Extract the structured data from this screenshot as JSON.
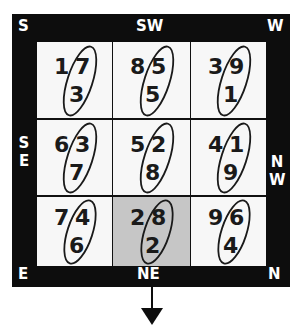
{
  "diagram": {
    "directions": {
      "top_left": "S",
      "top_center": "SW",
      "top_right": "W",
      "left_center": [
        "S",
        "E"
      ],
      "right_center": [
        "N",
        "W"
      ],
      "bottom_left": "E",
      "bottom_center": "NE",
      "bottom_right": "N"
    },
    "cells": [
      {
        "row": 0,
        "col": 0,
        "top_left": "1",
        "top_right": "7",
        "bottom": "3",
        "highlighted": false
      },
      {
        "row": 0,
        "col": 1,
        "top_left": "8",
        "top_right": "5",
        "bottom": "5",
        "highlighted": false
      },
      {
        "row": 0,
        "col": 2,
        "top_left": "3",
        "top_right": "9",
        "bottom": "1",
        "highlighted": false
      },
      {
        "row": 1,
        "col": 0,
        "top_left": "6",
        "top_right": "3",
        "bottom": "7",
        "highlighted": false
      },
      {
        "row": 1,
        "col": 1,
        "top_left": "5",
        "top_right": "2",
        "bottom": "8",
        "highlighted": false
      },
      {
        "row": 1,
        "col": 2,
        "top_left": "4",
        "top_right": "1",
        "bottom": "9",
        "highlighted": false
      },
      {
        "row": 2,
        "col": 0,
        "top_left": "7",
        "top_right": "4",
        "bottom": "6",
        "highlighted": false
      },
      {
        "row": 2,
        "col": 1,
        "top_left": "2",
        "top_right": "8",
        "bottom": "2",
        "highlighted": true
      },
      {
        "row": 2,
        "col": 2,
        "top_left": "9",
        "top_right": "6",
        "bottom": "4",
        "highlighted": false
      }
    ],
    "arrow": {
      "direction": "down",
      "anchor": "NE"
    },
    "colors": {
      "frame": "#0d0d0d",
      "cell": "#f7f7f7",
      "highlight": "#c6c6c6",
      "text": "#1a1a1a",
      "label": "#ffffff"
    }
  }
}
